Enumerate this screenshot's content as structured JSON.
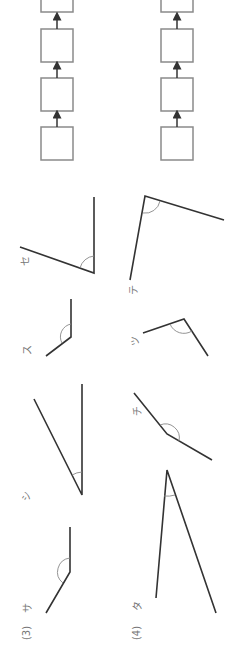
{
  "worksheet": {
    "orientation": "rotated -90deg",
    "problems": [
      {
        "number": "(3)",
        "angles": [
          {
            "label": "サ",
            "type": "obtuse"
          },
          {
            "label": "シ",
            "type": "acute"
          },
          {
            "label": "ス",
            "type": "obtuse"
          },
          {
            "label": "セ",
            "type": "acute"
          }
        ],
        "answer_boxes": 4,
        "arrow": "↑"
      },
      {
        "number": "(4)",
        "angles": [
          {
            "label": "タ",
            "type": "acute"
          },
          {
            "label": "チ",
            "type": "obtuse"
          },
          {
            "label": "ツ",
            "type": "obtuse"
          },
          {
            "label": "テ",
            "type": "right-ish"
          }
        ],
        "answer_boxes": 4,
        "arrow": "↑"
      }
    ]
  },
  "colors": {
    "line": "#333333",
    "arc": "#888888",
    "box_border": "#8a8a8a",
    "label": "#777777"
  }
}
